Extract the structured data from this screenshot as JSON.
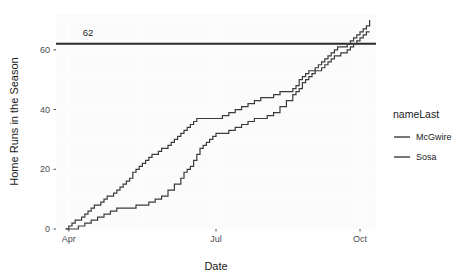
{
  "chart_data": {
    "type": "line",
    "title": "",
    "xlabel": "Date",
    "ylabel": "Home Runs in the Season",
    "grid": true,
    "legend_position": "right",
    "legend_title": "nameLast",
    "xlim": [
      0,
      200
    ],
    "ylim": [
      0,
      72
    ],
    "yticks": [
      0,
      20,
      40,
      60
    ],
    "ytick_labels": [
      "0",
      "20",
      "40",
      "60"
    ],
    "xticks": [
      8,
      100,
      190
    ],
    "xtick_labels": [
      "Apr",
      "Jul",
      "Oct"
    ],
    "annotations": [
      {
        "name": "record-line-62",
        "type": "hline",
        "y": 62,
        "label": "62",
        "label_x": 20,
        "label_y": 66,
        "color": "#2b2b2b"
      }
    ],
    "series": [
      {
        "name": "McGwire",
        "color": "#3b3b3b",
        "step": true,
        "points": [
          [
            6,
            0
          ],
          [
            8,
            1
          ],
          [
            10,
            2
          ],
          [
            12,
            3
          ],
          [
            14,
            3
          ],
          [
            16,
            4
          ],
          [
            18,
            5
          ],
          [
            20,
            6
          ],
          [
            22,
            7
          ],
          [
            24,
            8
          ],
          [
            26,
            8
          ],
          [
            28,
            9
          ],
          [
            30,
            10
          ],
          [
            32,
            11
          ],
          [
            34,
            11
          ],
          [
            36,
            12
          ],
          [
            38,
            13
          ],
          [
            40,
            14
          ],
          [
            42,
            15
          ],
          [
            44,
            16
          ],
          [
            46,
            17
          ],
          [
            48,
            19
          ],
          [
            50,
            20
          ],
          [
            52,
            21
          ],
          [
            54,
            22
          ],
          [
            56,
            23
          ],
          [
            58,
            24
          ],
          [
            60,
            25
          ],
          [
            62,
            25
          ],
          [
            64,
            26
          ],
          [
            66,
            27
          ],
          [
            68,
            27
          ],
          [
            70,
            28
          ],
          [
            72,
            29
          ],
          [
            74,
            30
          ],
          [
            76,
            31
          ],
          [
            78,
            32
          ],
          [
            80,
            33
          ],
          [
            82,
            34
          ],
          [
            84,
            35
          ],
          [
            86,
            36
          ],
          [
            88,
            37
          ],
          [
            90,
            37
          ],
          [
            92,
            37
          ],
          [
            96,
            37
          ],
          [
            100,
            37
          ],
          [
            104,
            38
          ],
          [
            108,
            39
          ],
          [
            112,
            40
          ],
          [
            116,
            41
          ],
          [
            120,
            42
          ],
          [
            124,
            43
          ],
          [
            128,
            44
          ],
          [
            132,
            44
          ],
          [
            136,
            45
          ],
          [
            140,
            46
          ],
          [
            144,
            46
          ],
          [
            148,
            47
          ],
          [
            150,
            48
          ],
          [
            152,
            50
          ],
          [
            154,
            51
          ],
          [
            156,
            52
          ],
          [
            158,
            53
          ],
          [
            160,
            53
          ],
          [
            162,
            54
          ],
          [
            164,
            55
          ],
          [
            166,
            56
          ],
          [
            168,
            57
          ],
          [
            170,
            58
          ],
          [
            172,
            59
          ],
          [
            174,
            60
          ],
          [
            176,
            61
          ],
          [
            178,
            61
          ],
          [
            180,
            61
          ],
          [
            182,
            62
          ],
          [
            184,
            63
          ],
          [
            186,
            64
          ],
          [
            188,
            65
          ],
          [
            190,
            66
          ],
          [
            192,
            67
          ],
          [
            194,
            68
          ],
          [
            196,
            70
          ]
        ]
      },
      {
        "name": "Sosa",
        "color": "#3b3b3b",
        "step": true,
        "points": [
          [
            6,
            0
          ],
          [
            10,
            0
          ],
          [
            14,
            1
          ],
          [
            18,
            2
          ],
          [
            22,
            3
          ],
          [
            26,
            4
          ],
          [
            30,
            5
          ],
          [
            34,
            6
          ],
          [
            38,
            7
          ],
          [
            42,
            7
          ],
          [
            46,
            7
          ],
          [
            50,
            8
          ],
          [
            54,
            8
          ],
          [
            58,
            9
          ],
          [
            62,
            10
          ],
          [
            66,
            11
          ],
          [
            70,
            13
          ],
          [
            74,
            15
          ],
          [
            78,
            17
          ],
          [
            80,
            19
          ],
          [
            82,
            20
          ],
          [
            84,
            21
          ],
          [
            86,
            23
          ],
          [
            88,
            25
          ],
          [
            90,
            27
          ],
          [
            92,
            28
          ],
          [
            94,
            29
          ],
          [
            96,
            30
          ],
          [
            98,
            31
          ],
          [
            100,
            32
          ],
          [
            104,
            32
          ],
          [
            108,
            33
          ],
          [
            112,
            34
          ],
          [
            116,
            35
          ],
          [
            120,
            36
          ],
          [
            124,
            37
          ],
          [
            128,
            37
          ],
          [
            132,
            38
          ],
          [
            136,
            39
          ],
          [
            140,
            41
          ],
          [
            144,
            43
          ],
          [
            148,
            45
          ],
          [
            150,
            46
          ],
          [
            152,
            47
          ],
          [
            154,
            49
          ],
          [
            156,
            50
          ],
          [
            158,
            51
          ],
          [
            160,
            52
          ],
          [
            162,
            53
          ],
          [
            164,
            53
          ],
          [
            166,
            54
          ],
          [
            168,
            55
          ],
          [
            170,
            56
          ],
          [
            172,
            57
          ],
          [
            174,
            58
          ],
          [
            176,
            58
          ],
          [
            178,
            59
          ],
          [
            180,
            59
          ],
          [
            182,
            60
          ],
          [
            184,
            61
          ],
          [
            186,
            62
          ],
          [
            188,
            63
          ],
          [
            190,
            64
          ],
          [
            192,
            65
          ],
          [
            194,
            66
          ],
          [
            196,
            66
          ]
        ]
      }
    ]
  },
  "panel": {
    "background": "#fbfbfb",
    "gridline_color": "#ffffff",
    "axis_text_color": "#4d4d4d",
    "axis_title_color": "#1a1a1a"
  }
}
